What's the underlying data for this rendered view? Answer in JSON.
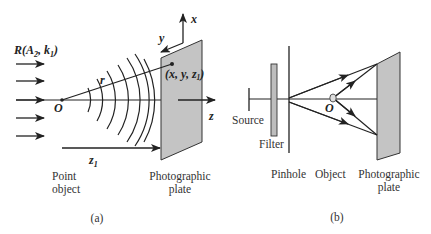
{
  "figure": {
    "panel_a": {
      "caption": "(a)",
      "incident_wave_label": "R(A",
      "incident_wave_sub1": "2",
      "incident_wave_mid": ", k",
      "incident_wave_sub2": "1",
      "incident_wave_end": ")",
      "origin_label": "O",
      "radius_label": "r",
      "point_label": "(x, y, z",
      "point_sub": "1",
      "point_end": ")",
      "axis_x_label": "x",
      "axis_y_label": "y",
      "axis_z_label": "z",
      "distance_label": "z",
      "distance_sub": "1",
      "point_object_label_1": "Point",
      "point_object_label_2": "object",
      "plate_label_1": "Photographic",
      "plate_label_2": "plate"
    },
    "panel_b": {
      "caption": "(b)",
      "source_label": "Source",
      "filter_label": "Filter",
      "pinhole_label": "Pinhole",
      "object_label": "Object",
      "origin_label": "O",
      "plate_label_1": "Photographic",
      "plate_label_2": "plate"
    },
    "colors": {
      "line": "#222222",
      "plate_fill": "#c4c4c4",
      "filter_fill": "#bdbdbd",
      "text": "#333333"
    }
  }
}
